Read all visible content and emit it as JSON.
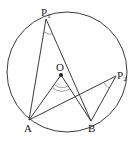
{
  "diagram": {
    "circle": {
      "cx": 67,
      "cy": 72,
      "r": 60
    },
    "points": {
      "P1": {
        "label": "P",
        "sub": "1",
        "x": 46,
        "y": 19
      },
      "P2": {
        "label": "P",
        "sub": "2",
        "x": 119,
        "y": 75
      },
      "O": {
        "label": "O",
        "x": 61,
        "y": 75
      },
      "A": {
        "label": "A",
        "x": 29,
        "y": 120
      },
      "B": {
        "label": "B",
        "x": 91,
        "y": 121
      }
    },
    "segments": [
      [
        "P1",
        "A"
      ],
      [
        "P1",
        "B"
      ],
      [
        "P2",
        "A"
      ],
      [
        "P2",
        "B"
      ],
      [
        "O",
        "A"
      ],
      [
        "O",
        "B"
      ]
    ],
    "angle_marks": [
      "angle-AP1B",
      "angle-AP2B",
      "angle-AOB-double"
    ],
    "colors": {
      "stroke": "#3a3a3a",
      "background": "#ffffff"
    }
  }
}
